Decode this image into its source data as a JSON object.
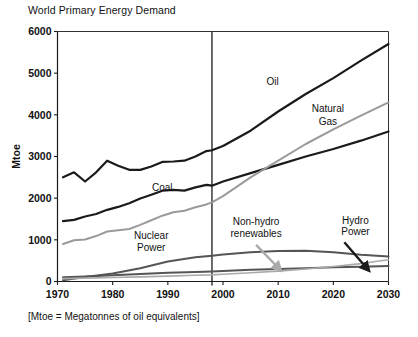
{
  "chart_data": {
    "type": "line",
    "title": "World Primary Energy Demand",
    "footnote": "[Mtoe = Megatonnes of oil equivalents]",
    "xlabel": "",
    "ylabel": "Mtoe",
    "xlim": [
      1970,
      2030
    ],
    "ylim": [
      0,
      6000
    ],
    "xticks": [
      1970,
      1980,
      1990,
      2000,
      2010,
      2020,
      2030
    ],
    "xtick_labels": [
      "1970",
      "1980",
      "1990",
      "2000",
      "2010",
      "2020",
      "2030"
    ],
    "yticks": [
      0,
      1000,
      2000,
      3000,
      4000,
      5000,
      6000
    ],
    "ytick_labels": [
      "0",
      "1000",
      "2000",
      "3000",
      "4000",
      "5000",
      "6000"
    ],
    "grid": false,
    "legend_position": "inline-annotations",
    "divider_year": 1998,
    "divider_note": "vertical rule separating history from projection",
    "series": [
      {
        "name": "Oil",
        "color": "#1a1a1a",
        "width": 2.2,
        "x": [
          1971,
          1973,
          1975,
          1977,
          1979,
          1981,
          1983,
          1985,
          1987,
          1989,
          1991,
          1993,
          1995,
          1997,
          1998,
          2000,
          2005,
          2010,
          2015,
          2020,
          2025,
          2030
        ],
        "values": [
          2500,
          2620,
          2400,
          2620,
          2900,
          2780,
          2680,
          2680,
          2760,
          2870,
          2880,
          2900,
          3000,
          3130,
          3150,
          3250,
          3620,
          4080,
          4500,
          4880,
          5300,
          5700
        ]
      },
      {
        "name": "Coal",
        "color": "#1a1a1a",
        "width": 2.2,
        "x": [
          1971,
          1973,
          1975,
          1977,
          1979,
          1981,
          1983,
          1985,
          1987,
          1989,
          1991,
          1993,
          1995,
          1997,
          1998,
          2000,
          2005,
          2010,
          2015,
          2020,
          2025,
          2030
        ],
        "values": [
          1450,
          1480,
          1560,
          1620,
          1720,
          1790,
          1880,
          1990,
          2080,
          2180,
          2200,
          2180,
          2260,
          2320,
          2300,
          2400,
          2600,
          2800,
          3000,
          3180,
          3380,
          3600
        ]
      },
      {
        "name": "Natural Gas",
        "color": "#9a9a9a",
        "width": 2.0,
        "x": [
          1971,
          1973,
          1975,
          1977,
          1979,
          1981,
          1983,
          1985,
          1987,
          1989,
          1991,
          1993,
          1995,
          1997,
          1998,
          2000,
          2005,
          2010,
          2015,
          2020,
          2025,
          2030
        ],
        "values": [
          900,
          990,
          1010,
          1090,
          1200,
          1230,
          1260,
          1360,
          1470,
          1580,
          1660,
          1700,
          1780,
          1850,
          1900,
          2050,
          2500,
          2900,
          3300,
          3650,
          3980,
          4300
        ]
      },
      {
        "name": "Nuclear Power",
        "color": "#555555",
        "width": 2.0,
        "x": [
          1971,
          1975,
          1980,
          1985,
          1990,
          1995,
          1998,
          2000,
          2005,
          2010,
          2015,
          2020,
          2025,
          2030
        ],
        "values": [
          30,
          110,
          190,
          320,
          480,
          580,
          620,
          650,
          700,
          730,
          740,
          700,
          640,
          600
        ]
      },
      {
        "name": "Hydro Power",
        "color": "#555555",
        "width": 2.0,
        "x": [
          1971,
          1975,
          1980,
          1985,
          1990,
          1995,
          1998,
          2000,
          2005,
          2010,
          2015,
          2020,
          2025,
          2030
        ],
        "values": [
          100,
          120,
          150,
          180,
          210,
          230,
          240,
          250,
          280,
          300,
          320,
          340,
          355,
          370
        ]
      },
      {
        "name": "Non-hydro renewables",
        "color": "#aaaaaa",
        "width": 1.6,
        "x": [
          1971,
          1975,
          1980,
          1985,
          1990,
          1995,
          1998,
          2000,
          2005,
          2010,
          2015,
          2020,
          2025,
          2030
        ],
        "values": [
          70,
          80,
          95,
          110,
          130,
          150,
          160,
          175,
          210,
          250,
          300,
          360,
          430,
          520
        ]
      }
    ],
    "annotations": [
      {
        "text": "Oil",
        "x": 2009,
        "y": 4720,
        "align": "middle"
      },
      {
        "text": "Natural",
        "x": 2019,
        "y": 4060,
        "align": "middle"
      },
      {
        "text": "Gas",
        "x": 2019,
        "y": 3760,
        "align": "middle"
      },
      {
        "text": "Coal",
        "x": 1989,
        "y": 2180,
        "align": "middle"
      },
      {
        "text": "Nuclear",
        "x": 1987,
        "y": 1010,
        "align": "middle"
      },
      {
        "text": "Power",
        "x": 1987,
        "y": 730,
        "align": "middle"
      },
      {
        "text": "Non-hydro",
        "x": 2006,
        "y": 1350,
        "align": "middle"
      },
      {
        "text": "renewables",
        "x": 2006,
        "y": 1070,
        "align": "middle"
      },
      {
        "text": "Hydro",
        "x": 2024,
        "y": 1390,
        "align": "middle"
      },
      {
        "text": "Power",
        "x": 2024,
        "y": 1110,
        "align": "middle"
      }
    ],
    "arrows": [
      {
        "name": "non-hydro-renewables-arrow",
        "color": "#aaaaaa",
        "x1": 2006,
        "y1": 880,
        "x2": 2010,
        "y2": 330
      },
      {
        "name": "hydro-power-arrow",
        "color": "#1a1a1a",
        "x1": 2022,
        "y1": 940,
        "x2": 2026,
        "y2": 330
      }
    ]
  }
}
